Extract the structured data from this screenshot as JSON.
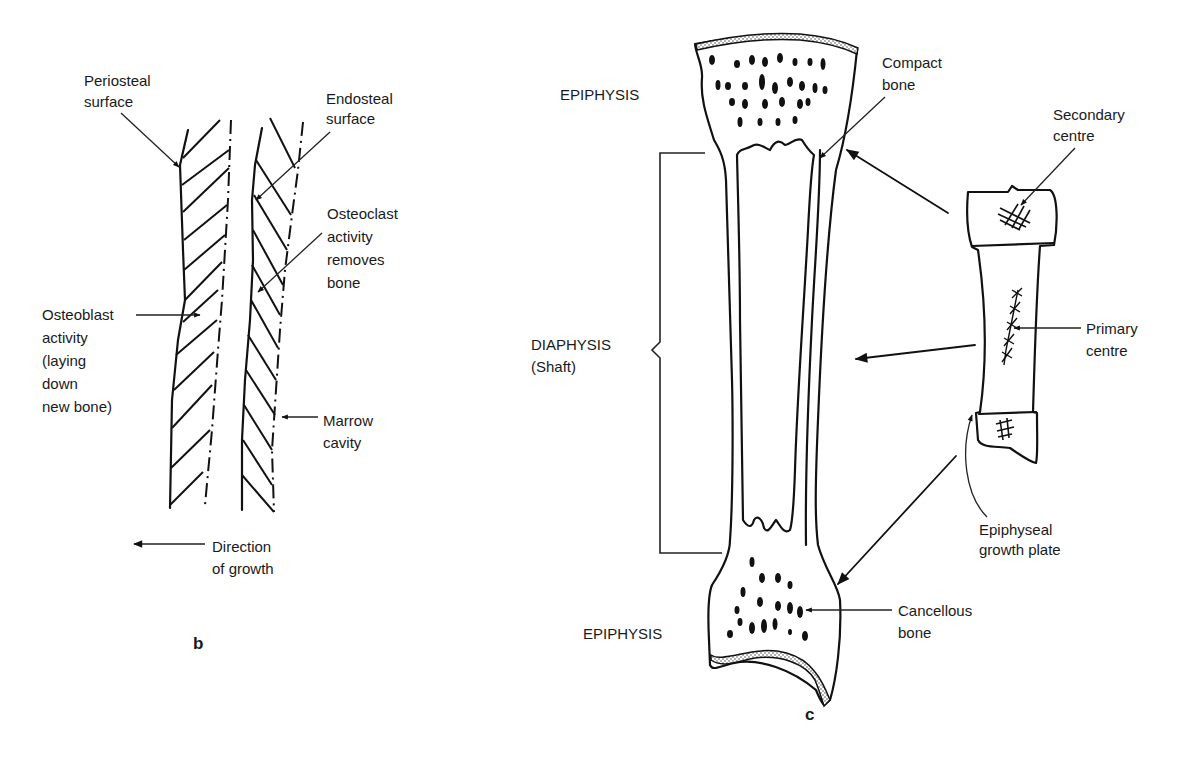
{
  "panel_b": {
    "caption": "b",
    "labels": {
      "periosteal_1": "Periosteal",
      "periosteal_2": "surface",
      "endosteal_1": "Endosteal",
      "endosteal_2": "surface",
      "osteoclast_1": "Osteoclast",
      "osteoclast_2": "activity",
      "osteoclast_3": "removes",
      "osteoclast_4": "bone",
      "osteoblast_1": "Osteoblast",
      "osteoblast_2": "activity",
      "osteoblast_3": "(laying",
      "osteoblast_4": "down",
      "osteoblast_5": "new bone)",
      "marrow_1": "Marrow",
      "marrow_2": "cavity",
      "direction_1": "Direction",
      "direction_2": "of growth"
    }
  },
  "panel_c": {
    "caption": "c",
    "labels": {
      "epiphysis_top": "EPIPHYSIS",
      "epiphysis_bottom": "EPIPHYSIS",
      "diaphysis_1": "DIAPHYSIS",
      "diaphysis_2": "(Shaft)",
      "compact_1": "Compact",
      "compact_2": "bone",
      "secondary_1": "Secondary",
      "secondary_2": "centre",
      "primary_1": "Primary",
      "primary_2": "centre",
      "plate_1": "Epiphyseal",
      "plate_2": "growth plate",
      "cancellous_1": "Cancellous",
      "cancellous_2": "bone"
    }
  }
}
